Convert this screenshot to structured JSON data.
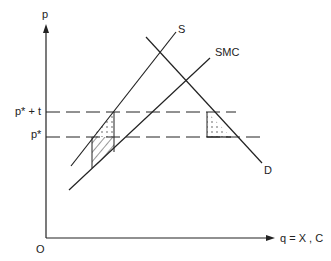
{
  "diagram": {
    "axes": {
      "y_label": "p",
      "x_label": "q = X , C",
      "origin_label": "O"
    },
    "price_levels": [
      {
        "label": "p* + t",
        "y": 112
      },
      {
        "label": "p*",
        "y": 137
      }
    ],
    "curves": [
      {
        "name": "S",
        "label": "S"
      },
      {
        "name": "SMC",
        "label": "SMC"
      },
      {
        "name": "D",
        "label": "D"
      }
    ],
    "colors": {
      "line": "#222222",
      "background": "#ffffff"
    }
  }
}
